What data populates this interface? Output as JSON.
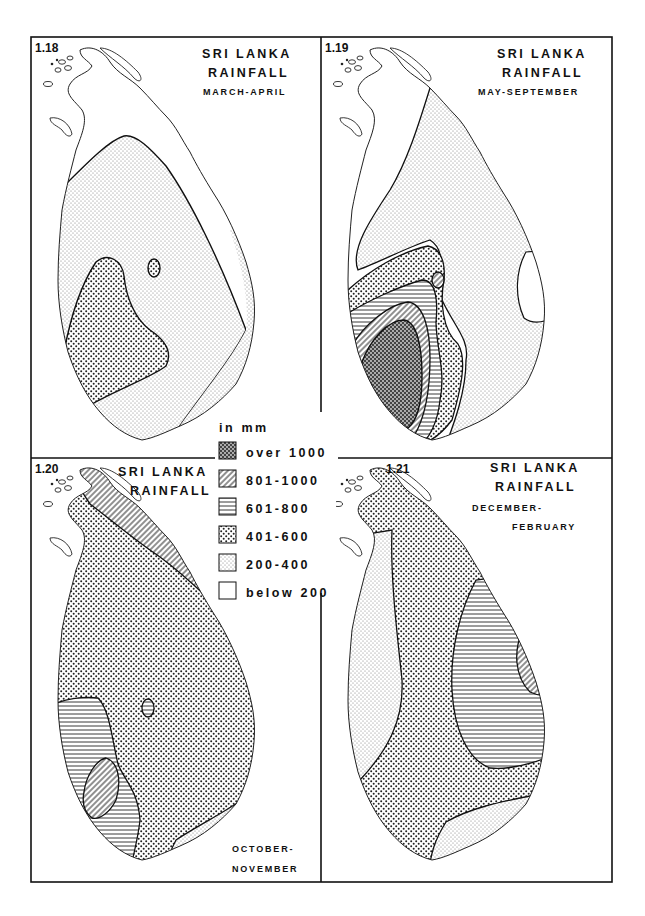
{
  "figure": {
    "legend": {
      "unit_label": "in mm",
      "classes": [
        {
          "id": "over1000",
          "label": "over 1000",
          "pattern": "dense-dark-dots"
        },
        {
          "id": "801-1000",
          "label": "801-1000",
          "pattern": "diagonal-hatch"
        },
        {
          "id": "601-800",
          "label": "601-800",
          "pattern": "horizontal-lines"
        },
        {
          "id": "401-600",
          "label": "401-600",
          "pattern": "medium-dots"
        },
        {
          "id": "200-400",
          "label": "200-400",
          "pattern": "fine-light-dots"
        },
        {
          "id": "below200",
          "label": "below 200",
          "pattern": "blank"
        }
      ]
    },
    "panels": [
      {
        "number": "1.18",
        "title_line1": "SRI LANKA",
        "title_line2": "RAINFALL",
        "period": "MARCH-APRIL",
        "zones": [
          "below 200",
          "200-400",
          "401-600"
        ]
      },
      {
        "number": "1.19",
        "title_line1": "SRI LANKA",
        "title_line2": "RAINFALL",
        "period": "MAY-SEPTEMBER",
        "zones": [
          "below 200",
          "200-400",
          "401-600",
          "601-800",
          "801-1000",
          "over 1000"
        ]
      },
      {
        "number": "1.20",
        "title_line1": "SRI LANKA",
        "title_line2": "RAINFALL",
        "period_line1": "OCTOBER-",
        "period_line2": "NOVEMBER",
        "zones": [
          "200-400",
          "401-600",
          "601-800",
          "801-1000"
        ]
      },
      {
        "number": "1.21",
        "title_line1": "SRI LANKA",
        "title_line2": "RAINFALL",
        "period_line1": "DECEMBER-",
        "period_line2": "FEBRUARY",
        "zones": [
          "200-400",
          "401-600",
          "601-800",
          "801-1000"
        ]
      }
    ]
  }
}
